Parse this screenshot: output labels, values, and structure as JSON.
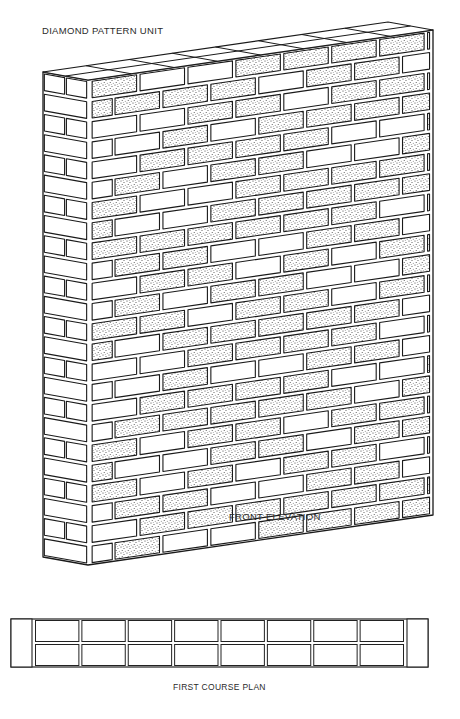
{
  "title": "DIAMOND PATTERN UNIT",
  "front_elevation_label": "FRONT ELEVATION",
  "plan_label": "FIRST COURSE PLAN",
  "wall": {
    "courses": 24,
    "corner_top": [
      88,
      80
    ],
    "corner_bottom": [
      88,
      565
    ],
    "right_top": [
      433,
      30
    ],
    "left_top": [
      43,
      72
    ],
    "stipple_color": "#333333",
    "line_color": "#1a1a1a"
  },
  "plan": {
    "x": 11,
    "y": 619,
    "width": 417,
    "height": 48,
    "cap_width": 21,
    "columns": 8,
    "rows": 2
  }
}
